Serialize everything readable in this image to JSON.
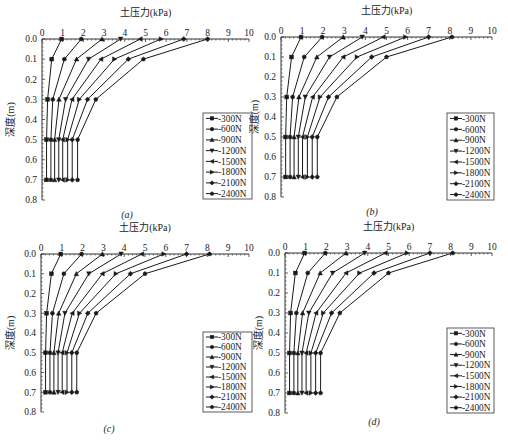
{
  "figure": {
    "x_title": "土压力(kPa)",
    "y_title": "深度(m)",
    "x_ticks": [
      "0",
      "1",
      "2",
      "3",
      "4",
      "5",
      "6",
      "7",
      "8",
      "9",
      "10"
    ],
    "y_ticks": [
      "0.0",
      "0.1",
      "0.2",
      "0.3",
      "0.4",
      "0.5",
      "0.6",
      "0.7",
      "0.8"
    ],
    "legend": [
      "300N",
      "600N",
      "900N",
      "1200N",
      "1500N",
      "1800N",
      "2100N",
      "2400N"
    ],
    "markers": [
      "square",
      "circle",
      "triangle-up",
      "triangle-down",
      "triangle-left",
      "triangle-right",
      "diamond",
      "pentagon"
    ],
    "colors": {
      "line": "#1a1a1a",
      "axis": "#333333",
      "background": "#ffffff"
    },
    "captions": [
      "(a)",
      "(b)",
      "(c)",
      "(d)"
    ]
  },
  "chart_data": [
    {
      "type": "line",
      "panel": "(a)",
      "title": "",
      "xlabel": "土压力(kPa)",
      "ylabel": "深度(m)",
      "xlim": [
        0,
        10
      ],
      "ylim": [
        0.8,
        0.0
      ],
      "x_axis_position": "top",
      "y_inverted": true,
      "grid": false,
      "legend_position": "lower right",
      "depths": [
        0.0,
        0.1,
        0.3,
        0.5,
        0.7
      ],
      "series": [
        {
          "name": "300N",
          "marker": "square",
          "values": [
            0.95,
            0.47,
            0.27,
            0.22,
            0.22
          ]
        },
        {
          "name": "600N",
          "marker": "circle",
          "values": [
            1.9,
            1.08,
            0.52,
            0.43,
            0.43
          ]
        },
        {
          "name": "900N",
          "marker": "triangle-up",
          "values": [
            2.9,
            1.67,
            0.82,
            0.61,
            0.61
          ]
        },
        {
          "name": "1200N",
          "marker": "triangle-down",
          "values": [
            3.8,
            2.25,
            1.14,
            0.81,
            0.81
          ]
        },
        {
          "name": "1500N",
          "marker": "triangle-left",
          "values": [
            4.75,
            2.85,
            1.45,
            1.0,
            1.0
          ]
        },
        {
          "name": "1800N",
          "marker": "triangle-right",
          "values": [
            5.75,
            3.5,
            1.8,
            1.24,
            1.24
          ]
        },
        {
          "name": "2100N",
          "marker": "diamond",
          "values": [
            6.85,
            4.17,
            2.2,
            1.46,
            1.46
          ]
        },
        {
          "name": "2400N",
          "marker": "pentagon",
          "values": [
            8.0,
            4.9,
            2.6,
            1.72,
            1.72
          ]
        }
      ]
    },
    {
      "type": "line",
      "panel": "(b)",
      "title": "",
      "xlabel": "土压力(kPa)",
      "ylabel": "深度(m)",
      "xlim": [
        0,
        10
      ],
      "ylim": [
        0.8,
        0.0
      ],
      "x_axis_position": "top",
      "y_inverted": true,
      "grid": false,
      "legend_position": "lower right",
      "depths": [
        0.0,
        0.1,
        0.3,
        0.5,
        0.7
      ],
      "series": [
        {
          "name": "300N",
          "marker": "square",
          "values": [
            0.95,
            0.5,
            0.27,
            0.22,
            0.22
          ]
        },
        {
          "name": "600N",
          "marker": "circle",
          "values": [
            1.95,
            1.1,
            0.55,
            0.43,
            0.43
          ]
        },
        {
          "name": "900N",
          "marker": "triangle-up",
          "values": [
            2.95,
            1.7,
            0.85,
            0.62,
            0.62
          ]
        },
        {
          "name": "1200N",
          "marker": "triangle-down",
          "values": [
            3.85,
            2.3,
            1.15,
            0.82,
            0.82
          ]
        },
        {
          "name": "1500N",
          "marker": "triangle-left",
          "values": [
            4.85,
            2.95,
            1.5,
            1.02,
            1.02
          ]
        },
        {
          "name": "1800N",
          "marker": "triangle-right",
          "values": [
            5.9,
            3.6,
            1.85,
            1.25,
            1.25
          ]
        },
        {
          "name": "2100N",
          "marker": "diamond",
          "values": [
            7.0,
            4.3,
            2.25,
            1.48,
            1.48
          ]
        },
        {
          "name": "2400N",
          "marker": "pentagon",
          "values": [
            8.1,
            5.0,
            2.65,
            1.72,
            1.72
          ]
        }
      ]
    },
    {
      "type": "line",
      "panel": "(c)",
      "title": "",
      "xlabel": "土压力(kPa)",
      "ylabel": "深度(m)",
      "xlim": [
        0,
        10
      ],
      "ylim": [
        0.8,
        0.0
      ],
      "x_axis_position": "top",
      "y_inverted": true,
      "grid": false,
      "legend_position": "lower right",
      "depths": [
        0.0,
        0.1,
        0.3,
        0.5,
        0.7
      ],
      "series": [
        {
          "name": "300N",
          "marker": "square",
          "values": [
            0.95,
            0.5,
            0.27,
            0.22,
            0.22
          ]
        },
        {
          "name": "600N",
          "marker": "circle",
          "values": [
            1.95,
            1.1,
            0.55,
            0.43,
            0.43
          ]
        },
        {
          "name": "900N",
          "marker": "triangle-up",
          "values": [
            2.95,
            1.7,
            0.85,
            0.62,
            0.62
          ]
        },
        {
          "name": "1200N",
          "marker": "triangle-down",
          "values": [
            3.85,
            2.3,
            1.15,
            0.82,
            0.82
          ]
        },
        {
          "name": "1500N",
          "marker": "triangle-left",
          "values": [
            4.85,
            2.95,
            1.5,
            1.02,
            1.02
          ]
        },
        {
          "name": "1800N",
          "marker": "triangle-right",
          "values": [
            5.9,
            3.6,
            1.85,
            1.25,
            1.25
          ]
        },
        {
          "name": "2100N",
          "marker": "diamond",
          "values": [
            7.0,
            4.3,
            2.25,
            1.48,
            1.48
          ]
        },
        {
          "name": "2400N",
          "marker": "pentagon",
          "values": [
            8.1,
            5.0,
            2.65,
            1.72,
            1.72
          ]
        }
      ]
    },
    {
      "type": "line",
      "panel": "(d)",
      "title": "",
      "xlabel": "土压力(kPa)",
      "ylabel": "深度(m)",
      "xlim": [
        0,
        10
      ],
      "ylim": [
        0.8,
        0.0
      ],
      "x_axis_position": "top",
      "y_inverted": true,
      "grid": false,
      "legend_position": "lower right",
      "depths": [
        0.0,
        0.1,
        0.3,
        0.5,
        0.7
      ],
      "series": [
        {
          "name": "300N",
          "marker": "square",
          "values": [
            0.95,
            0.5,
            0.27,
            0.22,
            0.22
          ]
        },
        {
          "name": "600N",
          "marker": "circle",
          "values": [
            1.95,
            1.1,
            0.55,
            0.43,
            0.43
          ]
        },
        {
          "name": "900N",
          "marker": "triangle-up",
          "values": [
            2.95,
            1.7,
            0.85,
            0.62,
            0.62
          ]
        },
        {
          "name": "1200N",
          "marker": "triangle-down",
          "values": [
            3.85,
            2.3,
            1.15,
            0.82,
            0.82
          ]
        },
        {
          "name": "1500N",
          "marker": "triangle-left",
          "values": [
            4.85,
            2.95,
            1.5,
            1.02,
            1.02
          ]
        },
        {
          "name": "1800N",
          "marker": "triangle-right",
          "values": [
            5.9,
            3.6,
            1.85,
            1.25,
            1.25
          ]
        },
        {
          "name": "2100N",
          "marker": "diamond",
          "values": [
            7.0,
            4.3,
            2.25,
            1.48,
            1.48
          ]
        },
        {
          "name": "2400N",
          "marker": "pentagon",
          "values": [
            8.1,
            5.0,
            2.65,
            1.72,
            1.72
          ]
        }
      ]
    }
  ]
}
